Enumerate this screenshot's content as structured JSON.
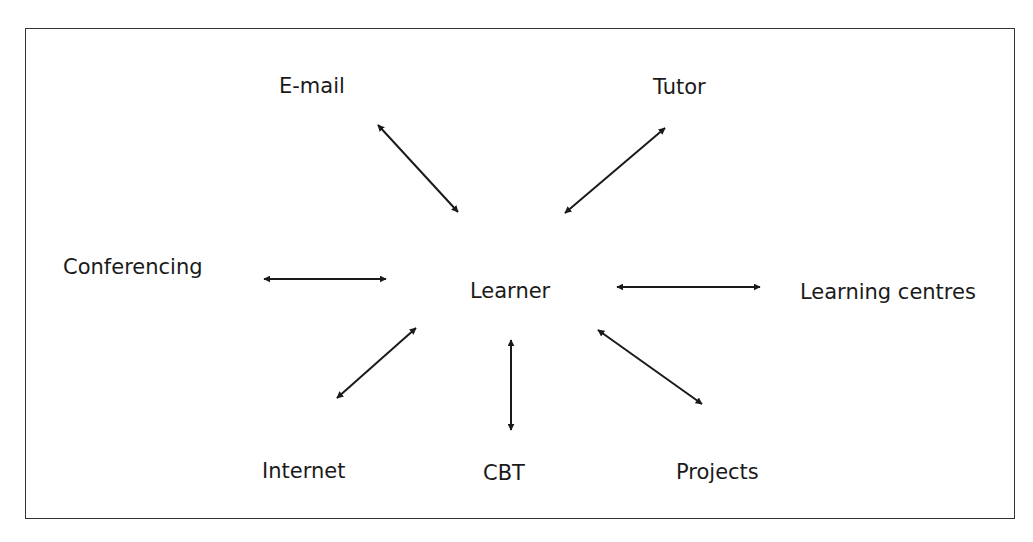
{
  "diagram": {
    "center": "Learner",
    "nodes": [
      {
        "id": "email",
        "label": "E-mail"
      },
      {
        "id": "tutor",
        "label": "Tutor"
      },
      {
        "id": "conferencing",
        "label": "Conferencing"
      },
      {
        "id": "learning_centres",
        "label": "Learning centres"
      },
      {
        "id": "internet",
        "label": "Internet"
      },
      {
        "id": "cbt",
        "label": "CBT"
      },
      {
        "id": "projects",
        "label": "Projects"
      }
    ],
    "edges": [
      {
        "from": "Learner",
        "to": "E-mail",
        "type": "bidirectional"
      },
      {
        "from": "Learner",
        "to": "Tutor",
        "type": "bidirectional"
      },
      {
        "from": "Learner",
        "to": "Conferencing",
        "type": "bidirectional"
      },
      {
        "from": "Learner",
        "to": "Learning centres",
        "type": "bidirectional"
      },
      {
        "from": "Learner",
        "to": "Internet",
        "type": "bidirectional"
      },
      {
        "from": "Learner",
        "to": "CBT",
        "type": "bidirectional"
      },
      {
        "from": "Learner",
        "to": "Projects",
        "type": "bidirectional"
      }
    ],
    "colors": {
      "line": "#1a1a1a",
      "text": "#1a1a1a",
      "frame": "#333333"
    }
  }
}
